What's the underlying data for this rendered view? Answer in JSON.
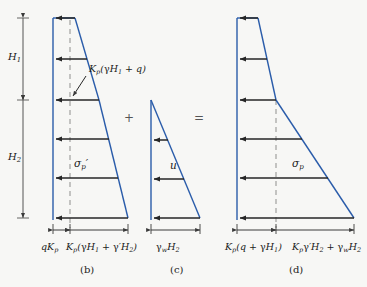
{
  "figure": {
    "background_color": "#f7f7f5",
    "line_color_pressure": "#2a5caa",
    "line_color_arrow": "#262626",
    "line_color_dashed": "#9a9a96"
  },
  "panels": [
    {
      "id": "b",
      "caption": "(b)",
      "description": "Effective passive pressure diagram with surcharge",
      "depth_labels": [
        "H1",
        "H2"
      ],
      "interior_label": "σ'p",
      "annotation": "Kp(γH1 + q)",
      "dimension_labels": [
        "qKp",
        "Kp(γH1 + γ'H2)"
      ],
      "arrow_count": 6
    },
    {
      "id": "c",
      "caption": "(c)",
      "description": "Hydrostatic pore water pressure diagram",
      "interior_label": "u",
      "dimension_labels": [
        "γwH2"
      ],
      "arrow_count": 3
    },
    {
      "id": "d",
      "caption": "(d)",
      "description": "Total passive pressure diagram",
      "interior_label": "σp",
      "dimension_labels": [
        "Kp(q + γH1)",
        "Kpγ'H2 + γwH2"
      ],
      "arrow_count": 6
    }
  ],
  "operators": {
    "plus": "+",
    "equals": "="
  },
  "labels": {
    "H1": "H",
    "H1_sub": "1",
    "H2": "H",
    "H2_sub": "2",
    "sigma_p_eff": "σ",
    "sigma_p_eff_sub": "p",
    "sigma_p": "σ",
    "sigma_p_sub": "p",
    "u": "u",
    "annotation_b": "K",
    "caption_b": "(b)",
    "caption_c": "(c)",
    "caption_d": "(d)"
  }
}
